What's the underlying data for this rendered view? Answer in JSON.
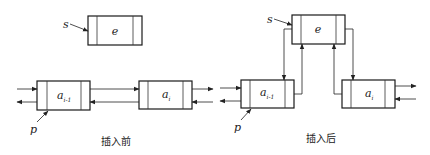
{
  "before": {
    "caption": "插入前",
    "pointer_s": "s",
    "pointer_p": "p",
    "node_e": "e",
    "node_prev": {
      "base": "a",
      "sub": "i-1"
    },
    "node_cur": {
      "base": "a",
      "sub": "i"
    }
  },
  "after": {
    "caption": "插入后",
    "pointer_s": "s",
    "pointer_p": "p",
    "node_e": "e",
    "node_prev": {
      "base": "a",
      "sub": "i-1"
    },
    "node_cur": {
      "base": "a",
      "sub": "i"
    }
  }
}
